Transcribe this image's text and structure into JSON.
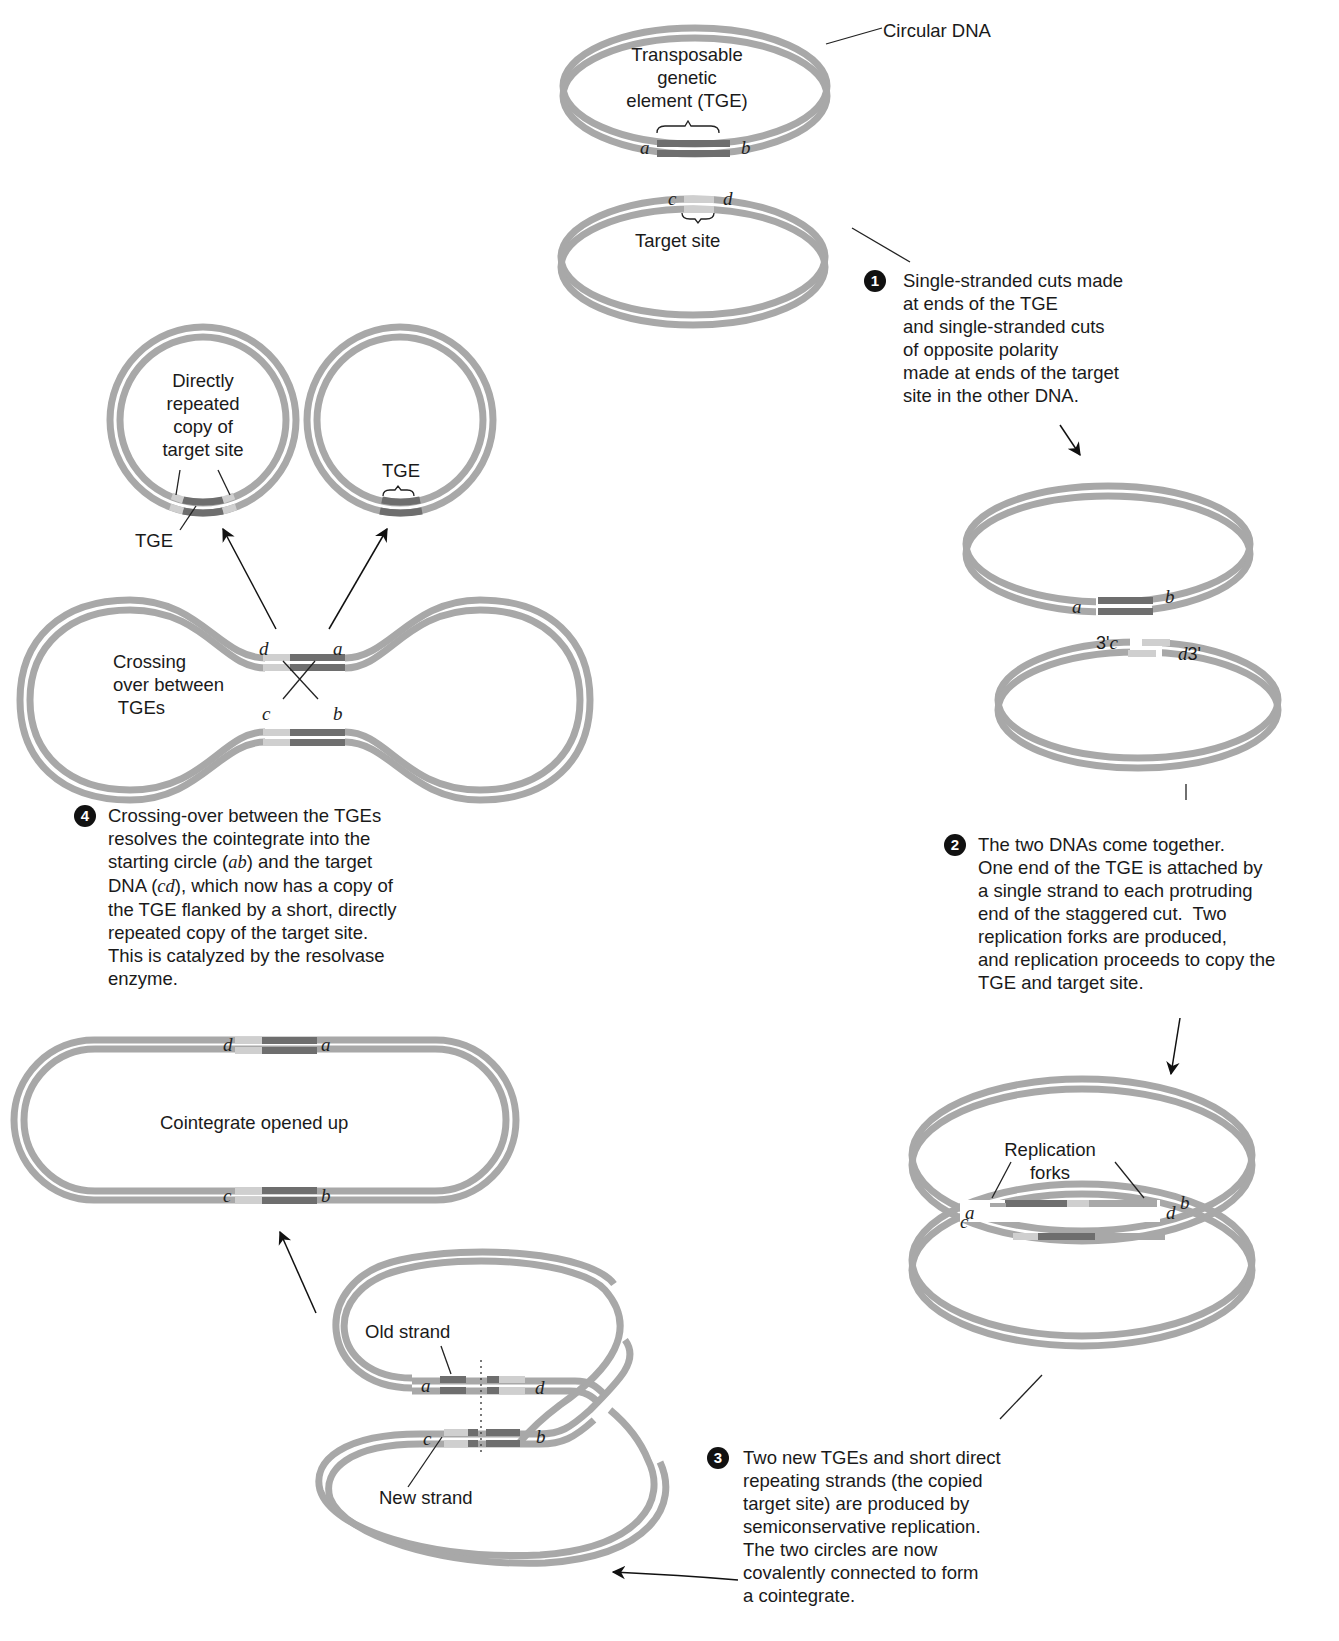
{
  "header": {
    "fragment": "Chapter fragment (cropped)"
  },
  "top": {
    "circular_dna_label": "Circular DNA",
    "tge_label": "Transposable\ngenetic\nelement (TGE)",
    "target_site_label": "Target site",
    "labels": {
      "a": "a",
      "b": "b",
      "c": "c",
      "d": "d"
    }
  },
  "steps": [
    {
      "number": "1",
      "text": "Single-stranded cuts made\nat ends of the TGE\nand single-stranded cuts\nof opposite polarity\nmade at ends of the target\nsite in the other DNA."
    },
    {
      "number": "2",
      "text": "The two DNAs come together.\nOne end of the TGE is attached by\na single strand to each protruding\nend of the staggered cut.  Two\nreplication forks are produced,\nand replication proceeds to copy the\nTGE and target site."
    },
    {
      "number": "3",
      "text": "Two new TGEs and short direct\nrepeating strands (the copied\ntarget site) are produced by\nsemiconservative replication.\nThe two circles are now\ncovalently connected to form\na cointegrate."
    },
    {
      "number": "4",
      "text_parts": [
        "Crossing-over between the TGEs\nresolves the cointegrate into the\nstarting circle (",
        "ab",
        ") and the target\nDNA (",
        "cd",
        "), which now has a copy of\nthe TGE flanked by a short, directly\nrepeated copy of the target site.\nThis is catalyzed by the resolvase\nenzyme."
      ]
    }
  ],
  "cut_stage": {
    "three_prime_left": "3'",
    "three_prime_right": "3'"
  },
  "replication": {
    "forks_label": "Replication\nforks"
  },
  "cointegrate": {
    "old_strand": "Old strand",
    "new_strand": "New strand",
    "opened_label": "Cointegrate opened up"
  },
  "resolution": {
    "crossing_label": "Crossing\nover between\n TGEs",
    "left_circle_label": "Directly\nrepeated\ncopy of\ntarget site",
    "tge_label_left": "TGE",
    "tge_label_right": "TGE"
  },
  "colors": {
    "dna_strand": "#a8a8a8",
    "tge": "#6e6e6e",
    "target": "#cfcfcf",
    "text": "#1a1a1a"
  }
}
